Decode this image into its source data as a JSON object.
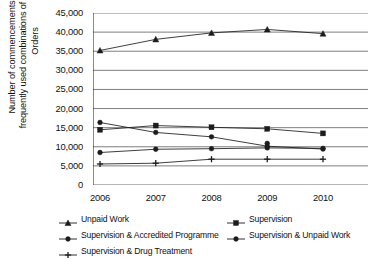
{
  "chart_data": {
    "type": "line",
    "title": "",
    "xlabel": "",
    "ylabel": "Number of commencements of most frequently used combinations of Community Orders",
    "categories": [
      "2006",
      "2007",
      "2008",
      "2009",
      "2010"
    ],
    "x": [
      2006,
      2007,
      2008,
      2009,
      2010
    ],
    "ylim": [
      0,
      45000
    ],
    "ytick_labels": [
      "0",
      "5,000",
      "10,000",
      "15,000",
      "20,000",
      "25,000",
      "30,000",
      "35,000",
      "40,000",
      "45,000"
    ],
    "ytick_values": [
      0,
      5000,
      10000,
      15000,
      20000,
      25000,
      30000,
      35000,
      40000,
      45000
    ],
    "grid": "horizontal",
    "legend_position": "bottom",
    "series": [
      {
        "name": "Unpaid Work",
        "marker": "triangle",
        "color": "#1c1c1c",
        "values": [
          35200,
          38100,
          39800,
          40700,
          39600
        ]
      },
      {
        "name": "Supervision",
        "marker": "square",
        "color": "#1c1c1c",
        "values": [
          14450,
          15550,
          15100,
          14700,
          13500
        ]
      },
      {
        "name": "Supervision & Accredited Programme",
        "marker": "circle",
        "color": "#1c1c1c",
        "values": [
          16350,
          13750,
          12600,
          10150,
          9400
        ]
      },
      {
        "name": "Supervision & Unpaid Work",
        "marker": "circle",
        "color": "#1c1c1c",
        "values": [
          8500,
          9350,
          9500,
          9700,
          9600
        ]
      },
      {
        "name": "Supervision & Drug Treatment",
        "marker": "plus",
        "color": "#1c1c1c",
        "values": [
          5500,
          5700,
          6750,
          6750,
          6750
        ]
      }
    ],
    "extra_points": [
      {
        "series": "Supervision & Accredited Programme",
        "x": 2009,
        "y": 10900
      }
    ]
  },
  "axis": {
    "y_title": "Number of commencements of most frequently used combinations of Community Orders"
  },
  "legend": {
    "items": [
      {
        "label": "Unpaid Work",
        "marker": "triangle"
      },
      {
        "label": "Supervision",
        "marker": "square"
      },
      {
        "label": "Supervision & Accredited Programme",
        "marker": "circle"
      },
      {
        "label": "Supervision & Unpaid Work",
        "marker": "circle"
      },
      {
        "label": "Supervision & Drug Treatment",
        "marker": "plus"
      }
    ]
  }
}
